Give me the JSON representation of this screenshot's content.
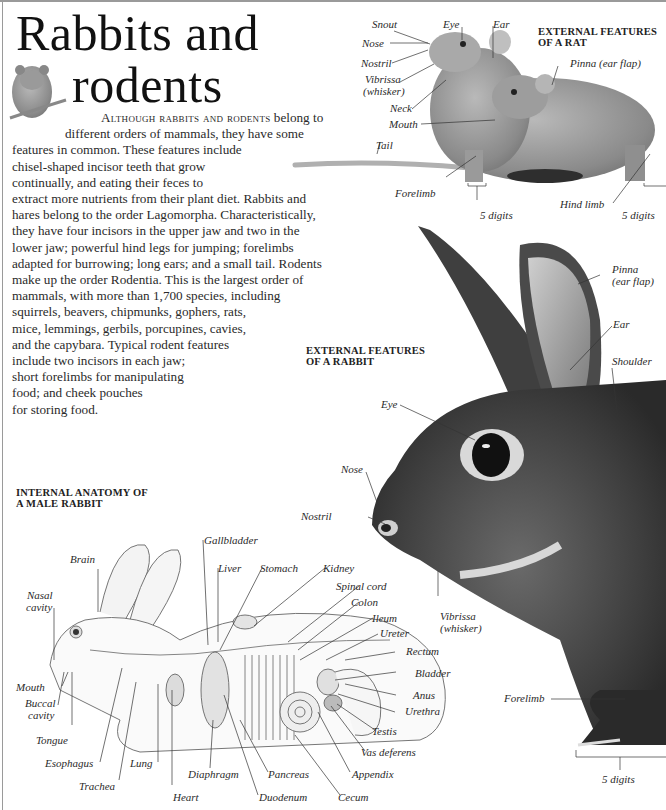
{
  "page": {
    "title_line1": "Rabbits and",
    "title_line2": "rodents"
  },
  "intro": {
    "lead_smallcaps": "Although rabbits and rodents",
    "lines": [
      " belong to",
      "different orders of mammals, they have some",
      "features in common. These features include",
      "chisel-shaped incisor teeth that grow",
      "continually, and eating their feces to",
      "extract more nutrients from their plant diet. Rabbits and",
      "hares belong to the order Lagomorpha. Characteristically,",
      "they have four incisors in the upper jaw and two in the",
      "lower jaw; powerful hind legs for jumping; forelimbs",
      "adapted for burrowing; long ears; and a small tail. Rodents",
      "make up the order Rodentia. This is the largest order of",
      "mammals, with more than 1,700 species, including",
      "squirrels, beavers, chipmunks, gophers, rats,",
      "mice, lemmings, gerbils, porcupines, cavies,",
      "and the capybara. Typical rodent features",
      "include two incisors in each jaw;",
      "short forelimbs for manipulating",
      "food; and cheek pouches",
      "for storing food."
    ]
  },
  "rat": {
    "heading_line1": "EXTERNAL FEATURES",
    "heading_line2": "OF A RAT",
    "labels": {
      "snout": "Snout",
      "nose": "Nose",
      "nostril": "Nostril",
      "vibrissa_1": "Vibrissa",
      "vibrissa_2": "(whisker)",
      "neck": "Neck",
      "mouth": "Mouth",
      "tail": "Tail",
      "forelimb": "Forelimb",
      "eye": "Eye",
      "ear": "Ear",
      "pinna": "Pinna (ear flap)",
      "hind_limb": "Hind limb",
      "digits_front": "5 digits",
      "digits_hind": "5 digits"
    }
  },
  "rabbit_external": {
    "heading_line1": "EXTERNAL FEATURES",
    "heading_line2": "OF A RABBIT",
    "labels": {
      "pinna_1": "Pinna",
      "pinna_2": "(ear flap)",
      "ear": "Ear",
      "shoulder": "Shoulder",
      "eye": "Eye",
      "nose": "Nose",
      "nostril": "Nostril",
      "vibrissa_1": "Vibrissa",
      "vibrissa_2": "(whisker)",
      "forelimb": "Forelimb",
      "digits": "5 digits"
    }
  },
  "rabbit_internal": {
    "heading_line1": "INTERNAL ANATOMY OF",
    "heading_line2": "A MALE RABBIT",
    "labels": {
      "brain": "Brain",
      "nasal_1": "Nasal",
      "nasal_2": "cavity",
      "mouth": "Mouth",
      "buccal_1": "Buccal",
      "buccal_2": "cavity",
      "tongue": "Tongue",
      "esophagus": "Esophagus",
      "trachea": "Trachea",
      "lung": "Lung",
      "heart": "Heart",
      "diaphragm": "Diaphragm",
      "duodenum": "Duodenum",
      "pancreas": "Pancreas",
      "cecum": "Cecum",
      "appendix": "Appendix",
      "vas_deferens": "Vas deferens",
      "testis": "Testis",
      "urethra": "Urethra",
      "anus": "Anus",
      "bladder": "Bladder",
      "rectum": "Rectum",
      "ureter": "Ureter",
      "ileum": "Ileum",
      "colon": "Colon",
      "spinal_cord": "Spinal cord",
      "kidney": "Kidney",
      "stomach": "Stomach",
      "liver": "Liver",
      "gallbladder": "Gallbladder"
    }
  }
}
